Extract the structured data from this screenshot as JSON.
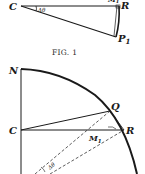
{
  "figure1": {
    "caption": "FIG. 1",
    "labels": {
      "C": "C",
      "R": "R",
      "P": "P",
      "P_sub": "1",
      "M": "M",
      "M_sub": "1",
      "angle": "Δθ"
    }
  },
  "figure2": {
    "labels": {
      "N": "N",
      "C": "C",
      "Q": "Q",
      "R": "R",
      "M": "M",
      "M_sub": "1",
      "angle": "Δθ"
    }
  },
  "colors": {
    "ink": "#1a1a1a",
    "background": "#ffffff"
  }
}
